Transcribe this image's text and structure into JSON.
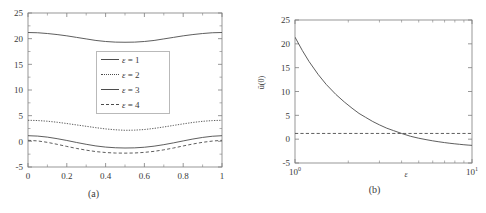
{
  "figure": {
    "panel_a_caption": "(a)",
    "panel_b_caption": "(b)"
  },
  "chart_data": [
    {
      "type": "line",
      "panel": "(a)",
      "title": "",
      "xlabel": "",
      "ylabel": "",
      "xlim": [
        0,
        1
      ],
      "ylim": [
        -5,
        25
      ],
      "xticks": [
        0,
        0.2,
        0.4,
        0.6,
        0.8,
        1
      ],
      "xtick_labels": [
        "0",
        "0.2",
        "0.4",
        "0.6",
        "0.8",
        "1"
      ],
      "yticks": [
        -5,
        0,
        5,
        10,
        15,
        20,
        25
      ],
      "ytick_labels": [
        "-5",
        "0",
        "5",
        "10",
        "15",
        "20",
        "25"
      ],
      "xscale": "linear",
      "yscale": "linear",
      "grid": false,
      "legend_position": "upper-center",
      "legend_entries": [
        "ε = 1",
        "ε = 2",
        "ε = 3",
        "ε = 4"
      ],
      "x": [
        0,
        0.05,
        0.1,
        0.15,
        0.2,
        0.25,
        0.3,
        0.35,
        0.4,
        0.45,
        0.5,
        0.55,
        0.6,
        0.65,
        0.7,
        0.75,
        0.8,
        0.85,
        0.9,
        0.95,
        1
      ],
      "series": [
        {
          "name": "ε = 1",
          "style": "solid",
          "values": [
            21.2,
            21.15,
            21.0,
            20.8,
            20.55,
            20.25,
            19.95,
            19.65,
            19.45,
            19.33,
            19.3,
            19.33,
            19.45,
            19.65,
            19.95,
            20.25,
            20.55,
            20.8,
            21.0,
            21.15,
            21.2
          ]
        },
        {
          "name": "ε = 2",
          "style": "dotted",
          "values": [
            4.1,
            4.05,
            3.92,
            3.72,
            3.47,
            3.2,
            2.93,
            2.66,
            2.42,
            2.25,
            2.15,
            2.18,
            2.3,
            2.52,
            2.8,
            3.1,
            3.4,
            3.68,
            3.9,
            4.04,
            4.1
          ]
        },
        {
          "name": "ε = 3",
          "style": "solid",
          "values": [
            1.1,
            1.02,
            0.82,
            0.52,
            0.17,
            -0.22,
            -0.58,
            -0.9,
            -1.12,
            -1.25,
            -1.3,
            -1.27,
            -1.15,
            -0.94,
            -0.65,
            -0.3,
            0.08,
            0.45,
            0.76,
            0.99,
            1.1
          ]
        },
        {
          "name": "ε = 4",
          "style": "dashed",
          "values": [
            0.2,
            0.08,
            -0.2,
            -0.58,
            -0.99,
            -1.38,
            -1.72,
            -2.0,
            -2.18,
            -2.28,
            -2.3,
            -2.27,
            -2.15,
            -1.95,
            -1.66,
            -1.3,
            -0.9,
            -0.52,
            -0.19,
            0.05,
            0.2
          ]
        }
      ]
    },
    {
      "type": "line",
      "panel": "(b)",
      "title": "",
      "xlabel": "ε",
      "ylabel": "ū(0)",
      "xlim": [
        1,
        10
      ],
      "ylim": [
        -5,
        25
      ],
      "xticks": [
        1,
        10
      ],
      "xtick_labels": [
        "10^0",
        "10^1"
      ],
      "yticks": [
        -5,
        0,
        5,
        10,
        15,
        20,
        25
      ],
      "ytick_labels": [
        "-5",
        "0",
        "5",
        "10",
        "15",
        "20",
        "25"
      ],
      "xscale": "log",
      "yscale": "linear",
      "grid": false,
      "legend_position": "none",
      "series": [
        {
          "name": "ū(0)",
          "style": "solid",
          "x": [
            1.0,
            1.1,
            1.2,
            1.35,
            1.5,
            1.7,
            1.9,
            2.1,
            2.3,
            2.5,
            2.75,
            3.0,
            3.3,
            3.6,
            4.0,
            4.5,
            5.0,
            5.5,
            6.0,
            6.5,
            7.0,
            7.5,
            8.0,
            8.5,
            9.0,
            9.5,
            10.0
          ],
          "values": [
            21.4,
            18.6,
            16.3,
            13.6,
            11.5,
            9.4,
            7.8,
            6.5,
            5.4,
            4.6,
            3.7,
            3.0,
            2.3,
            1.8,
            1.2,
            0.6,
            0.2,
            -0.1,
            -0.35,
            -0.55,
            -0.72,
            -0.86,
            -0.98,
            -1.08,
            -1.17,
            -1.24,
            -1.3
          ]
        },
        {
          "name": "reference-level",
          "style": "dashed",
          "x": [
            1.0,
            10.0
          ],
          "values": [
            1.2,
            1.2
          ]
        }
      ]
    }
  ]
}
